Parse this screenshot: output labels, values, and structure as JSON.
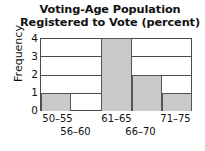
{
  "chart_data": {
    "type": "bar",
    "title": "Voting-Age Population Registered to Vote (percent)",
    "title_line1": "Voting-Age Population",
    "title_line2": "Registered to Vote (percent)",
    "xlabel": "",
    "ylabel": "Frequency",
    "categories": [
      "50–55",
      "56–60",
      "61–65",
      "66–70",
      "71–75"
    ],
    "values": [
      1,
      0,
      4,
      2,
      1
    ],
    "ylim": [
      0,
      4
    ],
    "yticks": [
      "0",
      "1",
      "2",
      "3",
      "4"
    ],
    "grid": "horizontal",
    "legend": "none",
    "bar_color": "#c9c9c9",
    "bar_border_color": "#555555",
    "axis_color": "#4a4a4a",
    "bins": [
      {
        "label": "50–55",
        "frequency": 1,
        "row": 1
      },
      {
        "label": "56–60",
        "frequency": 0,
        "row": 2
      },
      {
        "label": "61–65",
        "frequency": 4,
        "row": 1
      },
      {
        "label": "66–70",
        "frequency": 2,
        "row": 2
      },
      {
        "label": "71–75",
        "frequency": 1,
        "row": 1
      }
    ]
  }
}
